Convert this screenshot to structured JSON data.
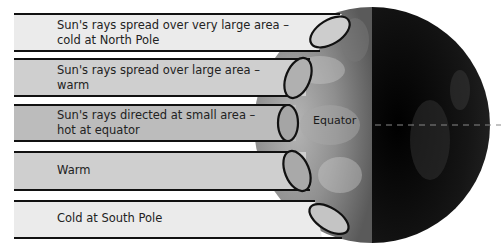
{
  "diagram": {
    "equator_label": "Equator",
    "bands": [
      {
        "line1": "Sun's rays spread over very large area –",
        "line2": "cold at North Pole",
        "fill": "#ebebeb"
      },
      {
        "line1": "Sun's rays spread over large area –",
        "line2": "warm",
        "fill": "#cfcfcf"
      },
      {
        "line1": "Sun's rays directed at small area –",
        "line2": "hot at equator",
        "fill": "#bcbcbc"
      },
      {
        "line1": "Warm",
        "line2": "",
        "fill": "#cfcfcf"
      },
      {
        "line1": "Cold at South Pole",
        "line2": "",
        "fill": "#ebebeb"
      }
    ],
    "colors": {
      "globe_day": "#8a8a8a",
      "globe_night": "#0d0d0d",
      "outline": "#111111",
      "equator_line": "#888888"
    }
  }
}
